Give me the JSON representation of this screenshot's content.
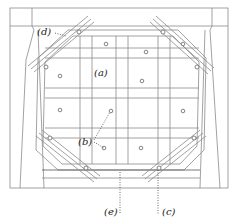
{
  "diagram": {
    "colors": {
      "line": "#8a8a8a",
      "dark": "#444444",
      "screw": "#666666"
    },
    "labels": [
      {
        "id": "a",
        "text": "(a)",
        "x": 94,
        "y": 68
      },
      {
        "id": "b",
        "text": "(b)",
        "x": 78,
        "y": 140
      },
      {
        "id": "c",
        "text": "(c)",
        "x": 162,
        "y": 207
      },
      {
        "id": "d",
        "text": "(d)",
        "x": 37,
        "y": 30
      },
      {
        "id": "e",
        "text": "(e)",
        "x": 109,
        "y": 207
      }
    ]
  }
}
